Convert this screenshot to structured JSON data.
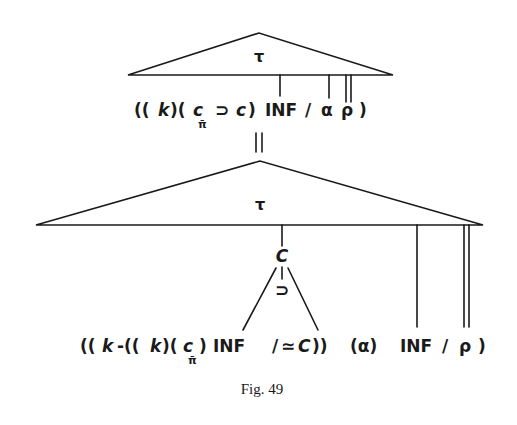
{
  "figure": {
    "caption": "Fig. 49",
    "top_tree": {
      "root_label": "τ",
      "formula": {
        "open": "((",
        "k": "k",
        "mid1": ")(",
        "c": "c",
        "c_sub": "π̄",
        "implies": "⊃",
        "c2": "c",
        "close1": ")",
        "inf": "INF",
        "slash": "/",
        "alpha": "α",
        "rho": "ρ",
        "close2": ")"
      }
    },
    "connector": "=",
    "bottom_tree": {
      "root_label": "τ",
      "node_label": "C",
      "node_operator": "⊃",
      "formula": {
        "open": "((",
        "k": "k",
        "minus": "-((",
        "k2": "k",
        "mid1": ")(",
        "c": "c",
        "c_sub": "π̄",
        "close1": ")",
        "inf": "INF",
        "slash": "/",
        "approx": "≃",
        "c2": "C",
        "close2": "))",
        "alpha_group": "(α)",
        "inf2": "INF",
        "slash2": "/",
        "rho": "ρ",
        "close3": ")"
      }
    }
  }
}
